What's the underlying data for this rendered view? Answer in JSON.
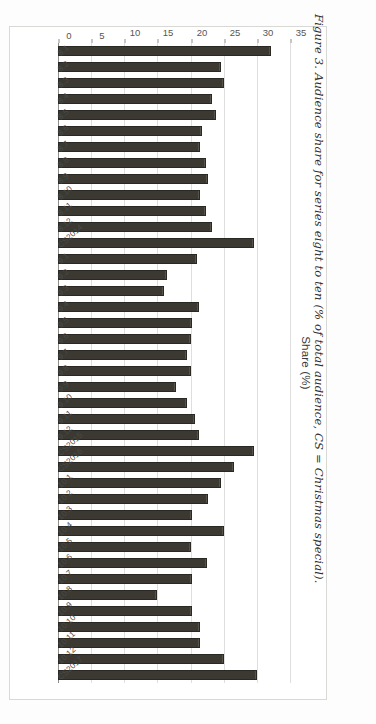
{
  "figure": {
    "caption": "Figure 3. Audience share for series eight to ten (% of total audience, CS = Christmas special)."
  },
  "chart_data": {
    "type": "bar",
    "orientation": "horizontal",
    "title": "",
    "xlabel": "",
    "ylabel": "Share (%)",
    "ylim": [
      0,
      35
    ],
    "yticks": [
      0,
      5,
      10,
      15,
      20,
      25,
      30,
      35
    ],
    "grid": true,
    "legend": false,
    "categories": [
      "8.1",
      "8.2",
      "8.3",
      "8.4",
      "8.5",
      "8.6",
      "8.7",
      "8.8",
      "8.9",
      "8.10",
      "8.11",
      "8.12",
      "CS2014",
      "9.1",
      "9.2",
      "9.3",
      "9.4",
      "9.5",
      "9.6",
      "9.7",
      "9.8",
      "9.9",
      "9.10",
      "9.11",
      "9.12",
      "CS2015",
      "CS2016",
      "10.1",
      "10.2",
      "10.3",
      "10.4",
      "10.5",
      "10.6",
      "10.7",
      "10.8",
      "10.9",
      "10.10",
      "10.11",
      "10.12",
      "CS2017"
    ],
    "values": [
      32.2,
      24.6,
      25.0,
      23.2,
      23.8,
      21.8,
      21.5,
      22.3,
      22.7,
      21.5,
      22.3,
      23.3,
      29.5,
      21.0,
      16.5,
      16.0,
      21.2,
      20.2,
      20.0,
      19.5,
      20.0,
      17.8,
      19.5,
      20.6,
      21.3,
      29.5,
      26.5,
      24.6,
      22.7,
      20.2,
      25.0,
      20.0,
      22.5,
      20.2,
      15.0,
      20.2,
      21.5,
      21.5,
      25.0,
      30.0
    ],
    "bar_color": "#3b3931"
  }
}
